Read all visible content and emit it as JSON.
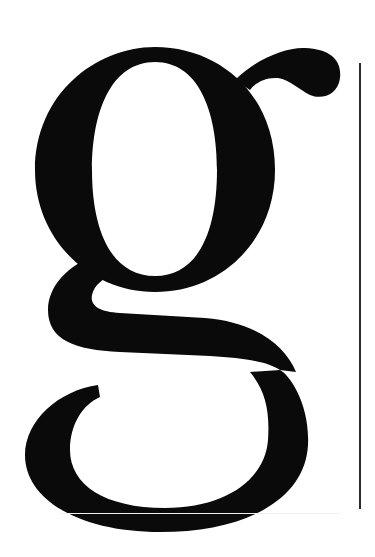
{
  "specimen": {
    "glyph": "g",
    "description": "Large serif lowercase g specimen",
    "colors": {
      "background": "#ffffff",
      "glyph": "#0a0a0a",
      "rule": "#2a2a2a"
    }
  }
}
